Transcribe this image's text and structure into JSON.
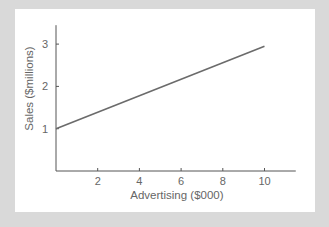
{
  "chart_data": {
    "type": "line",
    "title": "",
    "xlabel": "Advertising ($000)",
    "ylabel": "Sales ($millions)",
    "x_ticks": [
      2,
      4,
      6,
      8,
      10
    ],
    "y_ticks": [
      1,
      2,
      3
    ],
    "xlim": [
      0,
      11.5
    ],
    "ylim": [
      0,
      3.4
    ],
    "grid": false,
    "legend": null,
    "series": [
      {
        "name": "Sales vs Advertising",
        "x": [
          0,
          10
        ],
        "y": [
          1.0,
          2.95
        ]
      }
    ]
  },
  "colors": {
    "background": "#d9d9d9",
    "panel": "#ffffff",
    "axis": "#555555",
    "line": "#6b6b6b",
    "text": "#666666"
  }
}
